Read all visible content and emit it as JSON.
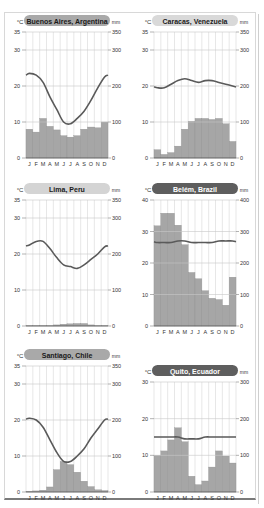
{
  "colors": {
    "bar": "#a6a6a6",
    "bar_edge": "#8c8c8c",
    "line": "#5a5a5a",
    "grid": "#c8c8c8",
    "axis_text": "#333333"
  },
  "units": {
    "temp": "°C",
    "precip": "mm"
  },
  "months": [
    "J",
    "F",
    "M",
    "A",
    "M",
    "J",
    "J",
    "A",
    "S",
    "O",
    "N",
    "D"
  ],
  "chart_data": [
    {
      "type": "bar+line",
      "title": "Buenos Aires, Argentina",
      "pill": {
        "bg": "#a9a9a9",
        "fg": "#1a1a1a"
      },
      "categories": [
        "J",
        "F",
        "M",
        "A",
        "M",
        "J",
        "J",
        "A",
        "S",
        "O",
        "N",
        "D"
      ],
      "ylim_temp": [
        0,
        35
      ],
      "temp_ticks": [
        0,
        10,
        20,
        30,
        35
      ],
      "ylim_precip": [
        0,
        350
      ],
      "precip_ticks": [
        0,
        100,
        200,
        300,
        350
      ],
      "series": [
        {
          "name": "Temperature (°C)",
          "type": "line",
          "values": [
            23.5,
            23,
            21,
            17,
            13.5,
            10,
            9.5,
            11,
            13,
            16,
            19.5,
            22.5
          ]
        },
        {
          "name": "Precipitation (mm)",
          "type": "bar",
          "values": [
            80,
            72,
            110,
            88,
            78,
            62,
            58,
            62,
            80,
            86,
            84,
            100
          ]
        }
      ],
      "xlabel": "",
      "ylabel_left": "°C",
      "ylabel_right": "mm",
      "grid": true
    },
    {
      "type": "bar+line",
      "title": "Caracas, Venezuela",
      "pill": {
        "bg": "#d9d9d9",
        "fg": "#1a1a1a"
      },
      "categories": [
        "J",
        "F",
        "M",
        "A",
        "M",
        "J",
        "J",
        "A",
        "S",
        "O",
        "N",
        "D"
      ],
      "ylim_temp": [
        0,
        35
      ],
      "temp_ticks": [
        0,
        10,
        20,
        30,
        35
      ],
      "ylim_precip": [
        0,
        350
      ],
      "precip_ticks": [
        0,
        100,
        200,
        300,
        350
      ],
      "series": [
        {
          "name": "Temperature (°C)",
          "type": "line",
          "values": [
            19.5,
            19.5,
            20.5,
            21.5,
            22,
            21.5,
            21,
            21.5,
            21.5,
            21,
            20.5,
            20
          ]
        },
        {
          "name": "Precipitation (mm)",
          "type": "bar",
          "values": [
            23,
            10,
            15,
            33,
            80,
            102,
            110,
            110,
            107,
            110,
            95,
            46
          ]
        }
      ],
      "xlabel": "",
      "ylabel_left": "°C",
      "ylabel_right": "mm",
      "grid": true
    },
    {
      "type": "bar+line",
      "title": "Lima, Peru",
      "pill": {
        "bg": "#d4d4d4",
        "fg": "#1a1a1a"
      },
      "categories": [
        "J",
        "F",
        "M",
        "A",
        "M",
        "J",
        "J",
        "A",
        "S",
        "O",
        "N",
        "D"
      ],
      "ylim_temp": [
        0,
        35
      ],
      "temp_ticks": [
        0,
        10,
        20,
        30,
        35
      ],
      "ylim_precip": [
        0,
        350
      ],
      "precip_ticks": [
        0,
        100,
        200,
        300,
        350
      ],
      "series": [
        {
          "name": "Temperature (°C)",
          "type": "line",
          "values": [
            22.5,
            23.5,
            23.5,
            21.5,
            19,
            17,
            16.5,
            16,
            17,
            18.5,
            20,
            22
          ]
        },
        {
          "name": "Precipitation (mm)",
          "type": "bar",
          "values": [
            1,
            1,
            1,
            1,
            3,
            5,
            6,
            7,
            7,
            3,
            1,
            1
          ]
        }
      ],
      "xlabel": "",
      "ylabel_left": "°C",
      "ylabel_right": "mm",
      "grid": true
    },
    {
      "type": "bar+line",
      "title": "Belém, Brazil",
      "pill": {
        "bg": "#5e5e5e",
        "fg": "#ffffff"
      },
      "categories": [
        "J",
        "F",
        "M",
        "A",
        "M",
        "J",
        "J",
        "A",
        "S",
        "O",
        "N",
        "D"
      ],
      "ylim_temp": [
        0,
        40
      ],
      "temp_ticks": [
        0,
        10,
        20,
        30,
        40
      ],
      "ylim_precip": [
        0,
        400
      ],
      "precip_ticks": [
        0,
        100,
        200,
        300,
        400
      ],
      "series": [
        {
          "name": "Temperature (°C)",
          "type": "line",
          "values": [
            26.5,
            26.5,
            26.5,
            27,
            27,
            26.5,
            26.5,
            26.5,
            26.5,
            27,
            27,
            27
          ]
        },
        {
          "name": "Precipitation (mm)",
          "type": "bar",
          "values": [
            318,
            358,
            358,
            320,
            258,
            170,
            150,
            112,
            88,
            84,
            66,
            155
          ]
        }
      ],
      "xlabel": "",
      "ylabel_left": "°C",
      "ylabel_right": "mm",
      "grid": true
    },
    {
      "type": "bar+line",
      "title": "Santiago, Chile",
      "pill": {
        "bg": "#a9a9a9",
        "fg": "#1a1a1a"
      },
      "categories": [
        "J",
        "F",
        "M",
        "A",
        "M",
        "J",
        "J",
        "A",
        "S",
        "O",
        "N",
        "D"
      ],
      "ylim_temp": [
        0,
        35
      ],
      "temp_ticks": [
        0,
        10,
        20,
        30,
        35
      ],
      "ylim_precip": [
        0,
        350
      ],
      "precip_ticks": [
        0,
        100,
        200,
        300,
        350
      ],
      "series": [
        {
          "name": "Temperature (°C)",
          "type": "line",
          "values": [
            20.5,
            20,
            18,
            14.5,
            11,
            8.5,
            8.5,
            10,
            12,
            15,
            17.5,
            20
          ]
        },
        {
          "name": "Precipitation (mm)",
          "type": "bar",
          "values": [
            2,
            3,
            5,
            14,
            62,
            85,
            76,
            55,
            30,
            15,
            6,
            4
          ]
        }
      ],
      "xlabel": "",
      "ylabel_left": "°C",
      "ylabel_right": "mm",
      "grid": true
    },
    {
      "type": "bar+line",
      "title": "Quito, Ecuador",
      "pill": {
        "bg": "#5e5e5e",
        "fg": "#ffffff"
      },
      "categories": [
        "J",
        "F",
        "M",
        "A",
        "M",
        "J",
        "J",
        "A",
        "S",
        "O",
        "N",
        "D"
      ],
      "ylim_temp": [
        0,
        30
      ],
      "temp_ticks": [
        0,
        10,
        20,
        30
      ],
      "ylim_precip": [
        0,
        300
      ],
      "precip_ticks": [
        0,
        100,
        200,
        300
      ],
      "series": [
        {
          "name": "Temperature (°C)",
          "type": "line",
          "values": [
            15,
            15,
            15,
            15,
            14.5,
            14.5,
            14.5,
            15,
            15,
            15,
            15,
            15
          ]
        },
        {
          "name": "Precipitation (mm)",
          "type": "bar",
          "values": [
            100,
            112,
            142,
            175,
            137,
            43,
            20,
            30,
            68,
            112,
            98,
            79
          ]
        }
      ],
      "xlabel": "",
      "ylabel_left": "°C",
      "ylabel_right": "mm",
      "grid": true
    }
  ]
}
